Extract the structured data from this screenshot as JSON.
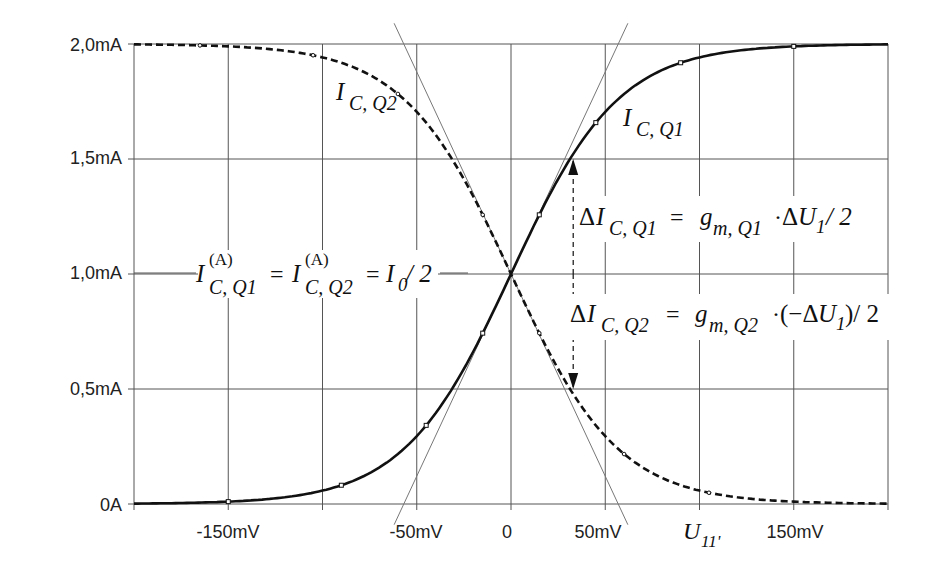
{
  "chart_data": {
    "type": "line",
    "title": "",
    "xlabel": "U_11'",
    "ylabel": "",
    "xlim": [
      -200,
      200
    ],
    "ylim": [
      0,
      2.0
    ],
    "x_unit": "mV",
    "y_unit": "mA",
    "grid": true,
    "x_gridlines": [
      -200,
      -150,
      -100,
      -50,
      0,
      50,
      100,
      150,
      200
    ],
    "y_gridlines": [
      0,
      0.5,
      1.0,
      1.5,
      2.0
    ],
    "x_tick_labels": [
      {
        "value": -150,
        "label": "-150mV"
      },
      {
        "value": -50,
        "label": "-50mV"
      },
      {
        "value": 0,
        "label": "0"
      },
      {
        "value": 50,
        "label": "50mV"
      },
      {
        "value": 150,
        "label": "150mV"
      }
    ],
    "y_tick_labels": [
      {
        "value": 2.0,
        "label": "2,0mA"
      },
      {
        "value": 1.5,
        "label": "1,5mA"
      },
      {
        "value": 1.0,
        "label": "1,0mA"
      },
      {
        "value": 0.5,
        "label": "0,5mA"
      },
      {
        "value": 0,
        "label": "0A"
      }
    ],
    "x": [
      -200,
      -175,
      -150,
      -125,
      -100,
      -75,
      -50,
      -37.5,
      -25,
      -12.5,
      0,
      12.5,
      25,
      37.5,
      50,
      75,
      100,
      125,
      150,
      175,
      200
    ],
    "series": [
      {
        "name": "I_C,Q1",
        "style": "solid",
        "values": [
          0.002,
          0.005,
          0.01,
          0.025,
          0.06,
          0.13,
          0.29,
          0.42,
          0.6,
          0.78,
          1.0,
          1.22,
          1.4,
          1.58,
          1.71,
          1.87,
          1.94,
          1.975,
          1.99,
          1.995,
          1.998
        ]
      },
      {
        "name": "I_C,Q2",
        "style": "dashed",
        "values": [
          1.998,
          1.995,
          1.99,
          1.975,
          1.94,
          1.87,
          1.71,
          1.58,
          1.4,
          1.22,
          1.0,
          0.78,
          0.6,
          0.42,
          0.29,
          0.13,
          0.06,
          0.025,
          0.01,
          0.005,
          0.002
        ]
      },
      {
        "name": "tangent Q1",
        "style": "thin",
        "points": [
          [
            -62,
            -0.09
          ],
          [
            62,
            2.09
          ]
        ]
      },
      {
        "name": "tangent Q2",
        "style": "thin",
        "points": [
          [
            -62,
            2.09
          ],
          [
            62,
            -0.09
          ]
        ]
      }
    ],
    "annotations": [
      {
        "text": "I_C,Q1",
        "x": 68,
        "y": 1.72
      },
      {
        "text": "I_C,Q2",
        "x": -103,
        "y": 1.72
      },
      {
        "text": "I_C,Q1^(A) = I_C,Q2^(A) = I_0/2",
        "x": -60,
        "y": 1.0
      },
      {
        "text": "ΔI_C,Q1 = g_m,Q1 · ΔU_1/2",
        "x": 38,
        "y": 1.26
      },
      {
        "text": "ΔI_C,Q2 = g_m,Q2 · (−ΔU_1)/2",
        "x": 38,
        "y": 0.75
      }
    ],
    "arrows": [
      {
        "x": 33,
        "from": 1.0,
        "to": 1.5,
        "direction": "up"
      },
      {
        "x": 33,
        "from": 1.0,
        "to": 0.5,
        "direction": "down"
      }
    ]
  },
  "labels": {
    "y": [
      "2,0mA",
      "1,5mA",
      "1,0mA",
      "0,5mA",
      "0A"
    ],
    "x": [
      "-150mV",
      "-50mV",
      "0",
      "50mV",
      "150mV"
    ],
    "xaxis_U": "U",
    "xaxis_sub": "11'",
    "q1_I": "I",
    "q1_sub": "C, Q1",
    "q2_I": "I",
    "q2_sub": "C, Q2",
    "op_I1": "I",
    "op_sup": "(A)",
    "op_sub1": "C, Q1",
    "op_eq": "=",
    "op_I2": "I",
    "op_sub2": "C, Q2",
    "op_eq2": "=",
    "op_I0": "I",
    "op_sub0": "0",
    "op_half": "/ 2",
    "d1_delta": "Δ",
    "d1_I": "I",
    "d1_sub": "C, Q1",
    "d1_eq": "=",
    "d1_g": "g",
    "d1_gsub": "m, Q1",
    "d1_dot": "·",
    "d1_dU": "Δ",
    "d1_U": "U",
    "d1_Usub": "1",
    "d1_half": "/ 2",
    "d2_delta": "Δ",
    "d2_I": "I",
    "d2_sub": "C, Q2",
    "d2_eq": "=",
    "d2_g": "g",
    "d2_gsub": "m, Q2",
    "d2_dot": "·",
    "d2_open": "(−Δ",
    "d2_U": "U",
    "d2_Usub": "1",
    "d2_close": ")/ 2"
  }
}
